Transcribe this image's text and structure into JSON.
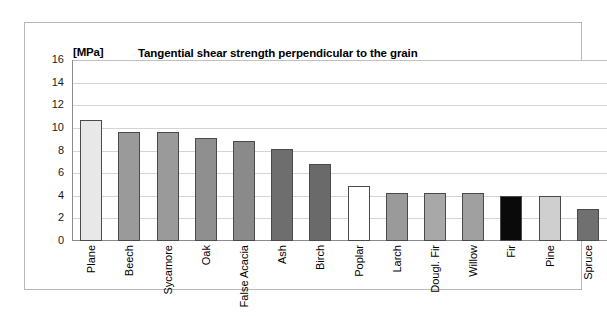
{
  "figure": {
    "unit_label": "[MPa]",
    "title": "Tangential shear strength perpendicular to the grain"
  },
  "chart_data": {
    "type": "bar",
    "title": "Tangential shear strength perpendicular to the grain",
    "xlabel": "",
    "ylabel": "[MPa]",
    "ylim": [
      0,
      16
    ],
    "yticks": [
      16,
      14,
      12,
      10,
      8,
      6,
      4,
      2,
      0
    ],
    "grid": true,
    "legend": "none",
    "categories": [
      "Plane",
      "Beech",
      "Sycamore",
      "Oak",
      "False Acacia",
      "Ash",
      "Birch",
      "Poplar",
      "Larch",
      "Dougl. Fir",
      "Willow",
      "Fir",
      "Pine",
      "Spruce"
    ],
    "values": [
      10.7,
      9.6,
      9.6,
      9.1,
      8.8,
      8.1,
      6.8,
      4.9,
      4.2,
      4.2,
      4.2,
      4.0,
      4.0,
      2.8
    ],
    "bar_colors": [
      "#e8e8e8",
      "#9a9a9a",
      "#9a9a9a",
      "#8f8f8f",
      "#8a8a8a",
      "#6e6e6e",
      "#6a6a6a",
      "#ffffff",
      "#9a9a9a",
      "#a8a8a8",
      "#a0a0a0",
      "#0a0a0a",
      "#cfcfcf",
      "#707070"
    ],
    "bar_border_color": "#4a4a4a",
    "axis_color": "#8c8c8c",
    "gridline_color": "#d4d4d4",
    "frame_color": "#b9b9b9",
    "background": "#ffffff"
  }
}
